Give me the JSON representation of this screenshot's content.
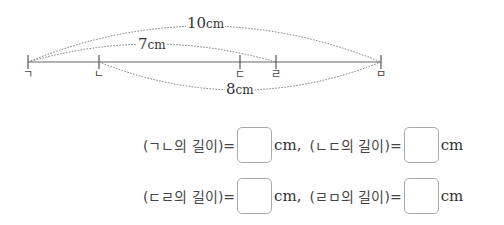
{
  "diagram": {
    "points": [
      {
        "label": "ㄱ",
        "x": 28
      },
      {
        "label": "ㄴ",
        "x": 99
      },
      {
        "label": "ㄷ",
        "x": 240
      },
      {
        "label": "ㄹ",
        "x": 276
      },
      {
        "label": "ㅁ",
        "x": 381
      }
    ],
    "measurements": [
      {
        "from": "ㄱ",
        "to": "ㅁ",
        "value": "10",
        "unit": "cm"
      },
      {
        "from": "ㄱ",
        "to": "ㄹ",
        "value": "7",
        "unit": "cm"
      },
      {
        "from": "ㄴ",
        "to": "ㅁ",
        "value": "8",
        "unit": "cm"
      }
    ]
  },
  "questions": [
    [
      {
        "expr": "(ㄱㄴ의 길이)=",
        "unit": "cm,",
        "answer": ""
      },
      {
        "expr": "(ㄴㄷ의 길이)=",
        "unit": "cm",
        "answer": ""
      }
    ],
    [
      {
        "expr": "(ㄷㄹ의 길이)=",
        "unit": "cm,",
        "answer": ""
      },
      {
        "expr": "(ㄹㅁ의 길이)=",
        "unit": "cm",
        "answer": ""
      }
    ]
  ]
}
